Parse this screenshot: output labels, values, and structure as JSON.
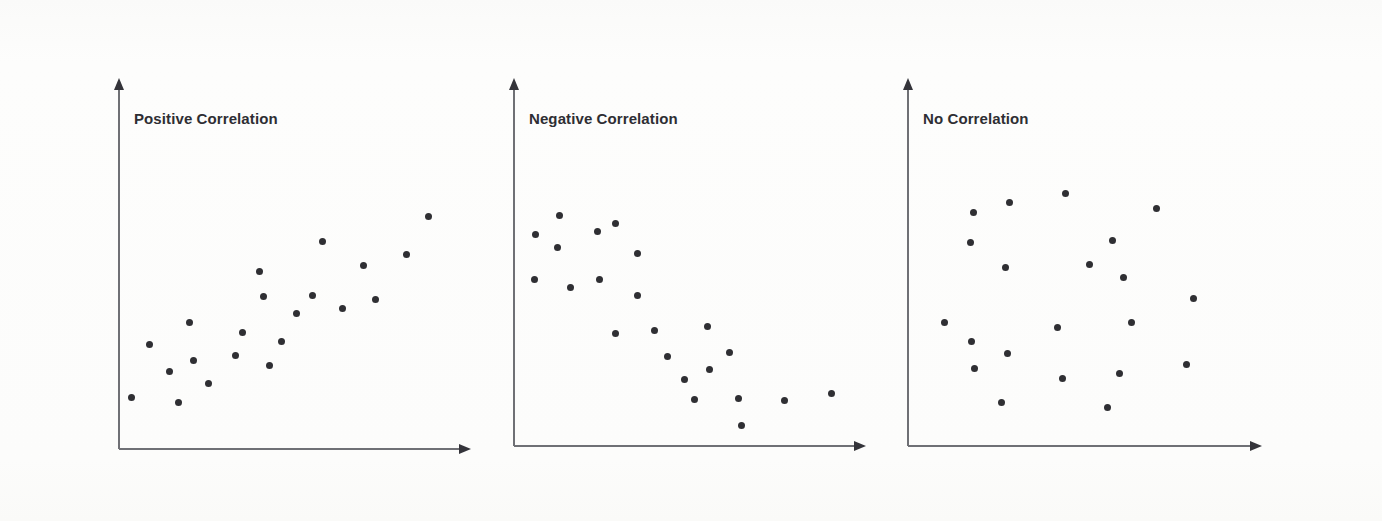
{
  "figure": {
    "title_visible": false,
    "background_color": "#fdfdfc",
    "axis_color": "#6f7075",
    "dot_color": "#2f2f33",
    "title_color": "#2e2e33"
  },
  "chart_data": [
    {
      "type": "scatter",
      "title": "Positive Correlation",
      "xlabel": "",
      "ylabel": "",
      "xlim": [
        0,
        100
      ],
      "ylim": [
        0,
        100
      ],
      "grid": false,
      "legend": "none",
      "axis_arrows": true,
      "n_points": 21,
      "points": [
        {
          "x": 3.7,
          "y": 16.5
        },
        {
          "x": 9.0,
          "y": 33.7
        },
        {
          "x": 15.0,
          "y": 25.0
        },
        {
          "x": 17.7,
          "y": 14.9
        },
        {
          "x": 21.0,
          "y": 40.7
        },
        {
          "x": 22.3,
          "y": 28.5
        },
        {
          "x": 26.8,
          "y": 21.2
        },
        {
          "x": 35.0,
          "y": 30.0
        },
        {
          "x": 37.0,
          "y": 37.4
        },
        {
          "x": 42.0,
          "y": 57.0
        },
        {
          "x": 43.3,
          "y": 48.9
        },
        {
          "x": 45.0,
          "y": 26.9
        },
        {
          "x": 48.7,
          "y": 34.7
        },
        {
          "x": 53.0,
          "y": 43.6
        },
        {
          "x": 58.0,
          "y": 49.3
        },
        {
          "x": 61.0,
          "y": 66.7
        },
        {
          "x": 67.0,
          "y": 45.3
        },
        {
          "x": 73.3,
          "y": 59.0
        },
        {
          "x": 76.7,
          "y": 48.2
        },
        {
          "x": 86.0,
          "y": 62.5
        },
        {
          "x": 92.7,
          "y": 74.8
        }
      ]
    },
    {
      "type": "scatter",
      "title": "Negative Correlation",
      "xlabel": "",
      "ylabel": "",
      "xlim": [
        0,
        100
      ],
      "ylim": [
        0,
        100
      ],
      "grid": false,
      "legend": "none",
      "axis_arrows": true,
      "n_points": 22,
      "points": [
        {
          "x": 6.4,
          "y": 68.6
        },
        {
          "x": 13.7,
          "y": 74.9
        },
        {
          "x": 6.0,
          "y": 54.0
        },
        {
          "x": 13.1,
          "y": 64.6
        },
        {
          "x": 17.0,
          "y": 51.3
        },
        {
          "x": 25.0,
          "y": 69.6
        },
        {
          "x": 30.3,
          "y": 72.1
        },
        {
          "x": 25.6,
          "y": 54.0
        },
        {
          "x": 37.0,
          "y": 62.5
        },
        {
          "x": 37.0,
          "y": 49.0
        },
        {
          "x": 30.3,
          "y": 36.6
        },
        {
          "x": 42.0,
          "y": 37.5
        },
        {
          "x": 46.0,
          "y": 29.0
        },
        {
          "x": 51.0,
          "y": 21.7
        },
        {
          "x": 58.0,
          "y": 38.8
        },
        {
          "x": 58.6,
          "y": 25.0
        },
        {
          "x": 54.0,
          "y": 15.0
        },
        {
          "x": 64.6,
          "y": 30.4
        },
        {
          "x": 67.3,
          "y": 15.3
        },
        {
          "x": 68.0,
          "y": 6.8
        },
        {
          "x": 81.1,
          "y": 14.9
        },
        {
          "x": 95.0,
          "y": 17.1
        }
      ]
    },
    {
      "type": "scatter",
      "title": "No Correlation",
      "xlabel": "",
      "ylabel": "",
      "xlim": [
        0,
        100
      ],
      "ylim": [
        0,
        100
      ],
      "grid": false,
      "legend": "none",
      "axis_arrows": true,
      "n_points": 21,
      "points": [
        {
          "x": 11.0,
          "y": 40.0
        },
        {
          "x": 19.5,
          "y": 75.9
        },
        {
          "x": 18.5,
          "y": 66.1
        },
        {
          "x": 19.0,
          "y": 34.0
        },
        {
          "x": 19.7,
          "y": 25.3
        },
        {
          "x": 30.3,
          "y": 79.0
        },
        {
          "x": 29.0,
          "y": 58.0
        },
        {
          "x": 29.5,
          "y": 30.0
        },
        {
          "x": 27.8,
          "y": 14.2
        },
        {
          "x": 47.0,
          "y": 82.0
        },
        {
          "x": 44.5,
          "y": 38.5
        },
        {
          "x": 46.0,
          "y": 22.0
        },
        {
          "x": 54.0,
          "y": 59.0
        },
        {
          "x": 61.0,
          "y": 66.8
        },
        {
          "x": 64.0,
          "y": 54.6
        },
        {
          "x": 66.5,
          "y": 40.2
        },
        {
          "x": 63.0,
          "y": 23.4
        },
        {
          "x": 59.5,
          "y": 12.5
        },
        {
          "x": 74.0,
          "y": 77.0
        },
        {
          "x": 83.0,
          "y": 26.4
        },
        {
          "x": 85.0,
          "y": 48.0
        }
      ]
    }
  ],
  "panels": [
    {
      "id": "positive",
      "title_label": "Positive Correlation",
      "axis_origin_x": 119,
      "axis_origin_y": 449,
      "axis_top_y": 78,
      "axis_right_x": 471
    },
    {
      "id": "negative",
      "title_label": "Negative Correlation",
      "axis_origin_x": 514,
      "axis_origin_y": 446,
      "axis_top_y": 78,
      "axis_right_x": 866
    },
    {
      "id": "no",
      "title_label": "No Correlation",
      "axis_origin_x": 908,
      "axis_origin_y": 446,
      "axis_top_y": 78,
      "axis_right_x": 1262
    }
  ]
}
